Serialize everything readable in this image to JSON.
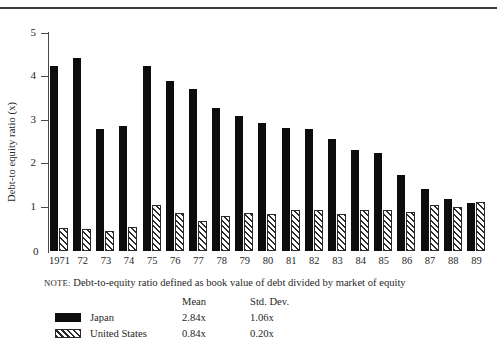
{
  "chart_data": {
    "type": "bar",
    "title": "",
    "xlabel": "",
    "ylabel": "Debt-to equity ratio (x)",
    "ylim": [
      0,
      5
    ],
    "yticks": [
      0,
      1,
      2,
      3,
      4,
      5
    ],
    "ytick_labels": [
      "0",
      "1",
      "2",
      "3",
      "4",
      "5"
    ],
    "grid": false,
    "legend_position": "below-plot",
    "categories": [
      "1971",
      "72",
      "73",
      "74",
      "75",
      "76",
      "77",
      "78",
      "79",
      "80",
      "81",
      "82",
      "83",
      "84",
      "85",
      "86",
      "87",
      "88",
      "89"
    ],
    "series": [
      {
        "name": "Japan",
        "color": "#0d0d0d",
        "fill": "solid",
        "values": [
          4.26,
          4.45,
          2.8,
          2.88,
          4.26,
          3.92,
          3.73,
          3.29,
          3.11,
          2.95,
          2.83,
          2.82,
          2.59,
          2.32,
          2.25,
          1.76,
          1.43,
          1.2,
          1.1
        ]
      },
      {
        "name": "United States",
        "color": "#2b2b2b",
        "fill": "diagonal-hatch",
        "values": [
          0.53,
          0.5,
          0.45,
          0.55,
          1.07,
          0.88,
          0.7,
          0.81,
          0.88,
          0.86,
          0.95,
          0.94,
          0.86,
          0.95,
          0.95,
          0.9,
          1.05,
          1.02,
          1.14
        ]
      }
    ],
    "annotations": {
      "note_prefix": "NOTE:",
      "note_text": "Debt-to-equity ratio defined as book value of debt divided by market of equity"
    },
    "stats_table": {
      "headers": [
        "",
        "Mean",
        "Std. Dev."
      ],
      "col_mean_header": "Mean",
      "col_sd_header": "Std. Dev.",
      "rows": [
        {
          "label": "Japan",
          "mean": "2.84x",
          "std_dev": "1.06x"
        },
        {
          "label": "United States",
          "mean": "0.84x",
          "std_dev": "0.20x"
        }
      ]
    }
  }
}
